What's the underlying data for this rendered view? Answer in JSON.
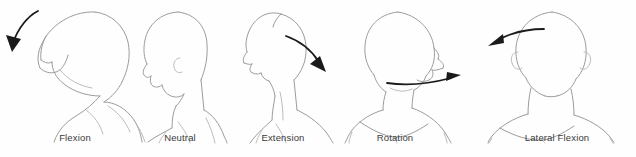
{
  "figure": {
    "background_color": "#fefefe",
    "outline_color": "#9c9c9c",
    "arrow_color": "#1a1a1a",
    "label_color": "#3a3a3a",
    "width": 636,
    "height": 157
  },
  "panels": [
    {
      "id": "flexion",
      "label": "Flexion",
      "label_x": 75,
      "label_y": 138,
      "view": "left-profile",
      "motion": "head bends forward and down",
      "arrow": {
        "name": "flexion-arrow",
        "direction": "down-left",
        "path": "M 38 11 C 28 16, 18 28, 13 43",
        "head_points": "13,50 8,36 19,38"
      }
    },
    {
      "id": "neutral",
      "label": "Neutral",
      "label_x": 180,
      "label_y": 138,
      "view": "left-profile",
      "motion": "head upright, no arrow",
      "arrow": null
    },
    {
      "id": "extension",
      "label": "Extension",
      "label_x": 283,
      "label_y": 138,
      "view": "left-profile",
      "motion": "head tilts backward, chin up",
      "arrow": {
        "name": "extension-arrow",
        "direction": "down-right",
        "path": "M 286 36 C 300 41, 313 52, 320 63",
        "head_points": "325,70 312,64 320,58"
      }
    },
    {
      "id": "rotation",
      "label": "Rotation",
      "label_x": 395,
      "label_y": 138,
      "view": "front-with-head-turned",
      "motion": "head rotates to the side",
      "arrow": {
        "name": "rotation-arrow",
        "direction": "right",
        "path": "M 388 83 C 410 86, 434 83, 452 78",
        "head_points": "459,76 447,80 448,73"
      }
    },
    {
      "id": "lateral-flexion",
      "label": "Lateral Flexion",
      "label_x": 557,
      "label_y": 138,
      "view": "front",
      "motion": "head tilts sideways toward shoulder",
      "arrow": {
        "name": "lateral-flexion-arrow",
        "direction": "left",
        "path": "M 543 29 C 526 29, 508 34, 497 40",
        "head_points": "489,45 501,35 503,43"
      }
    }
  ]
}
